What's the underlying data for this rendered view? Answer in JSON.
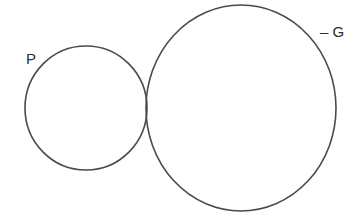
{
  "diagram": {
    "type": "two tangent circles",
    "circles": [
      {
        "id": "P",
        "label": "P",
        "relative_size": "small"
      },
      {
        "id": "G",
        "label": "G",
        "relative_size": "large"
      }
    ],
    "labels": {
      "small_circle": "P",
      "large_circle": "– G"
    },
    "relationship": "externally tangent",
    "colors": {
      "stroke": "#4a4a4a",
      "background": "#ffffff",
      "text": "#2b2b2b"
    }
  }
}
